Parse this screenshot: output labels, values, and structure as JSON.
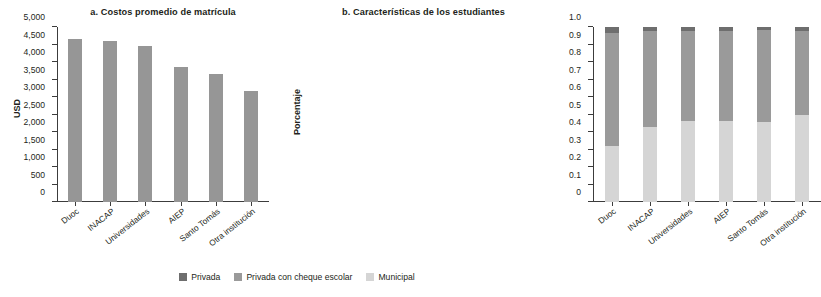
{
  "colors": {
    "privada": "#6e6e6e",
    "privada_cheque": "#9a9a9a",
    "municipal": "#d5d5d5",
    "bar_gray": "#969696",
    "axis": "#3c3c3c",
    "text": "#231f20"
  },
  "legend": {
    "items": [
      {
        "label": "Privada",
        "color": "#6e6e6e"
      },
      {
        "label": "Privada con cheque escolar",
        "color": "#9a9a9a"
      },
      {
        "label": "Municipal",
        "color": "#d5d5d5"
      }
    ]
  },
  "chart_data": [
    {
      "type": "bar",
      "panel": "a",
      "title": "a. Costos promedio de matrícula",
      "xlabel": "",
      "ylabel": "USD",
      "ylim": [
        0,
        5000
      ],
      "yticks": [
        0,
        500,
        1000,
        1500,
        2000,
        2500,
        3000,
        3500,
        4000,
        4500,
        5000
      ],
      "ytick_labels": [
        "0",
        "500",
        "1,000",
        "1,500",
        "2,000",
        "2,500",
        "3,000",
        "3,500",
        "4,000",
        "4,500",
        "5,000"
      ],
      "grid": false,
      "legend_position": "none",
      "categories": [
        "Duoc",
        "INACAP",
        "Universidades",
        "AIEP",
        "Santo Tomás",
        "Otra institución"
      ],
      "values": [
        4670,
        4610,
        4470,
        3870,
        3650,
        3180
      ]
    },
    {
      "type": "bar",
      "subtype": "stacked",
      "panel": "b",
      "title": "b. Características de los estudiantes",
      "xlabel": "",
      "ylabel": "Porcentaje",
      "ylim": [
        0,
        1.0
      ],
      "yticks": [
        0,
        0.1,
        0.2,
        0.3,
        0.4,
        0.5,
        0.6,
        0.7,
        0.8,
        0.9,
        1.0
      ],
      "ytick_labels": [
        "0",
        "0.1",
        "0.2",
        "0.3",
        "0.4",
        "0.5",
        "0.6",
        "0.7",
        "0.8",
        "0.9",
        "1.0"
      ],
      "grid": false,
      "legend_position": "bottom",
      "categories": [
        "Duoc",
        "INACAP",
        "Universidades",
        "AIEP",
        "Santo Tomás",
        "Otra institución"
      ],
      "series": [
        {
          "name": "Municipal",
          "color": "#d5d5d5",
          "values": [
            0.32,
            0.43,
            0.465,
            0.465,
            0.455,
            0.5
          ]
        },
        {
          "name": "Privada con cheque escolar",
          "color": "#9a9a9a",
          "values": [
            0.645,
            0.545,
            0.515,
            0.515,
            0.53,
            0.475
          ]
        },
        {
          "name": "Privada",
          "color": "#6e6e6e",
          "values": [
            0.035,
            0.025,
            0.02,
            0.02,
            0.015,
            0.025
          ]
        }
      ]
    }
  ]
}
